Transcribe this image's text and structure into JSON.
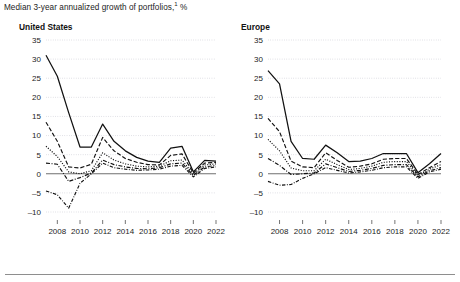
{
  "exhibit": {
    "title": "Median 3-year annualized growth of portfolios,",
    "footnote_marker": "1",
    "unit": "%"
  },
  "panels": [
    {
      "id": "us",
      "title": "United States"
    },
    {
      "id": "eu",
      "title": "Europe"
    }
  ],
  "chart_data": [
    {
      "type": "line",
      "title": "United States",
      "subtitle": "Median 3-year annualized growth of portfolios,¹ %",
      "xlabel": "",
      "ylabel": "%",
      "xlim": [
        2007,
        2022
      ],
      "ylim": [
        -10,
        35
      ],
      "yticks": [
        -10,
        -5,
        0,
        5,
        10,
        15,
        20,
        25,
        30,
        35
      ],
      "ytick_labels": [
        "–10",
        "–5",
        "0",
        "5",
        "10",
        "15",
        "20",
        "25",
        "30",
        "35"
      ],
      "xticks": [
        2008,
        2010,
        2012,
        2014,
        2016,
        2018,
        2020,
        2022
      ],
      "xtick_labels": [
        "2008",
        "2010",
        "2012",
        "2014",
        "2016",
        "2018",
        "2020",
        "2022"
      ],
      "x": [
        2007,
        2008,
        2009,
        2010,
        2011,
        2012,
        2013,
        2014,
        2015,
        2016,
        2017,
        2018,
        2019,
        2020,
        2021,
        2022
      ],
      "grid": true,
      "zero_line": true,
      "legend": "none",
      "series": [
        {
          "name": "top-quartile",
          "style": "solid",
          "values": [
            31.0,
            25.5,
            16.0,
            7.0,
            7.0,
            13.0,
            8.5,
            6.0,
            4.3,
            3.3,
            3.0,
            6.7,
            7.2,
            0.5,
            3.5,
            3.3
          ]
        },
        {
          "name": "upper-middle",
          "style": "dashed",
          "values": [
            13.5,
            8.5,
            1.8,
            1.5,
            2.5,
            9.5,
            6.0,
            4.0,
            3.0,
            2.4,
            2.3,
            4.8,
            5.2,
            0.2,
            2.8,
            3.0
          ]
        },
        {
          "name": "median",
          "style": "dotted",
          "values": [
            7.2,
            4.5,
            0.5,
            0.0,
            0.8,
            5.5,
            3.6,
            2.6,
            2.0,
            1.8,
            2.0,
            3.4,
            3.6,
            -0.1,
            2.3,
            2.6
          ]
        },
        {
          "name": "lower-middle",
          "style": "dash-dot",
          "values": [
            2.8,
            2.5,
            -2.0,
            -1.0,
            0.2,
            3.6,
            2.4,
            1.8,
            1.4,
            1.3,
            1.6,
            2.6,
            2.8,
            -0.4,
            1.8,
            2.2
          ]
        },
        {
          "name": "bottom-quartile",
          "style": "dash-dot-2",
          "values": [
            -4.5,
            -5.5,
            -9.0,
            -2.5,
            0.0,
            2.8,
            1.6,
            1.2,
            0.9,
            1.0,
            1.2,
            2.0,
            2.2,
            -0.8,
            1.4,
            1.8
          ]
        }
      ]
    },
    {
      "type": "line",
      "title": "Europe",
      "subtitle": "Median 3-year annualized growth of portfolios,¹ %",
      "xlabel": "",
      "ylabel": "%",
      "xlim": [
        2007,
        2022
      ],
      "ylim": [
        -10,
        35
      ],
      "yticks": [
        -10,
        -5,
        0,
        5,
        10,
        15,
        20,
        25,
        30,
        35
      ],
      "ytick_labels": [
        "–10",
        "–5",
        "0",
        "5",
        "10",
        "15",
        "20",
        "25",
        "30",
        "35"
      ],
      "xticks": [
        2008,
        2010,
        2012,
        2014,
        2016,
        2018,
        2020,
        2022
      ],
      "xtick_labels": [
        "2008",
        "2010",
        "2012",
        "2014",
        "2016",
        "2018",
        "2020",
        "2022"
      ],
      "x": [
        2007,
        2008,
        2009,
        2010,
        2011,
        2012,
        2013,
        2014,
        2015,
        2016,
        2017,
        2018,
        2019,
        2020,
        2021,
        2022
      ],
      "grid": true,
      "zero_line": true,
      "legend": "none",
      "series": [
        {
          "name": "top-quartile",
          "style": "solid",
          "values": [
            27.0,
            23.5,
            8.5,
            4.0,
            3.8,
            7.5,
            5.5,
            3.2,
            3.3,
            4.0,
            5.3,
            5.3,
            5.3,
            0.3,
            2.6,
            5.3
          ]
        },
        {
          "name": "upper-middle",
          "style": "dashed",
          "values": [
            14.5,
            11.0,
            3.3,
            1.8,
            1.6,
            5.5,
            3.5,
            1.7,
            2.0,
            2.6,
            3.8,
            4.0,
            4.0,
            -0.2,
            1.6,
            3.2
          ]
        },
        {
          "name": "median",
          "style": "dotted",
          "values": [
            9.0,
            6.0,
            1.5,
            0.8,
            0.8,
            3.8,
            2.4,
            1.1,
            1.4,
            2.0,
            3.0,
            3.2,
            3.2,
            -0.5,
            1.2,
            2.4
          ]
        },
        {
          "name": "lower-middle",
          "style": "dash-dot",
          "values": [
            4.0,
            2.2,
            -0.2,
            0.0,
            0.2,
            2.6,
            1.6,
            0.6,
            0.9,
            1.4,
            2.2,
            2.4,
            2.4,
            -0.8,
            0.8,
            1.6
          ]
        },
        {
          "name": "bottom-quartile",
          "style": "dash-dot-2",
          "values": [
            -2.0,
            -3.0,
            -2.8,
            -1.2,
            0.0,
            1.6,
            0.9,
            0.2,
            0.5,
            0.9,
            1.6,
            1.8,
            1.8,
            -1.2,
            0.5,
            1.2
          ]
        }
      ]
    }
  ]
}
